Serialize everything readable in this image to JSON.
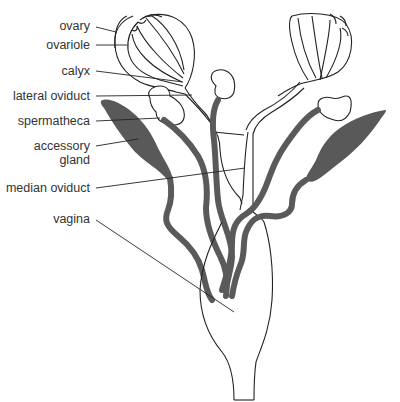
{
  "diagram": {
    "labels": [
      {
        "id": "ovary",
        "text": "ovary"
      },
      {
        "id": "ovariole",
        "text": "ovariole"
      },
      {
        "id": "calyx",
        "text": "calyx"
      },
      {
        "id": "lateral_oviduct",
        "text": "lateral oviduct"
      },
      {
        "id": "spermatheca",
        "text": "spermatheca"
      },
      {
        "id": "accessory_gland_1",
        "text": "accessory"
      },
      {
        "id": "accessory_gland_2",
        "text": "gland"
      },
      {
        "id": "median_oviduct",
        "text": "median oviduct"
      },
      {
        "id": "vagina",
        "text": "vagina"
      }
    ],
    "colors": {
      "outline": "#222222",
      "duct": "#5a5a5a",
      "gland": "#595959",
      "label": "#333333",
      "background": "#ffffff"
    }
  }
}
